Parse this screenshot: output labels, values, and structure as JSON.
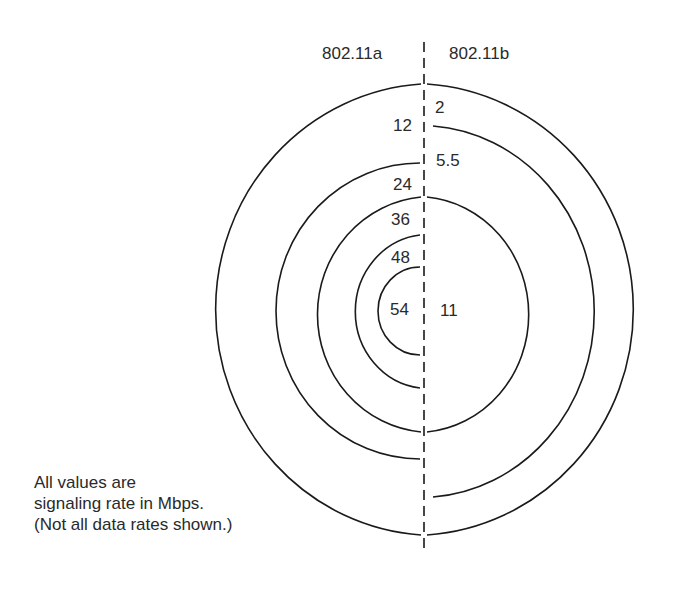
{
  "headers": {
    "left": "802.11a",
    "right": "802.11b"
  },
  "rates_80211a": [
    "12",
    "24",
    "36",
    "48",
    "54"
  ],
  "rates_80211b": [
    "2",
    "5.5",
    "11"
  ],
  "note": {
    "line1": "All values are",
    "line2": "signaling rate in Mbps.",
    "line3": "(Not all data rates shown.)"
  },
  "colors": {
    "stroke": "#1a1a1a",
    "text": "#2a2a2a",
    "background": "#ffffff"
  }
}
